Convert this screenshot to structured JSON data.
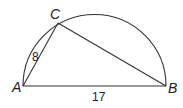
{
  "diagram": {
    "type": "semicircle-inscribed-triangle",
    "points": {
      "A": {
        "label": "A"
      },
      "B": {
        "label": "B"
      },
      "C": {
        "label": "C"
      }
    },
    "segments": {
      "AC": {
        "length_label": "8"
      },
      "AB": {
        "length_label": "17"
      }
    },
    "colors": {
      "stroke": "#333333",
      "background": "#ffffff"
    }
  }
}
